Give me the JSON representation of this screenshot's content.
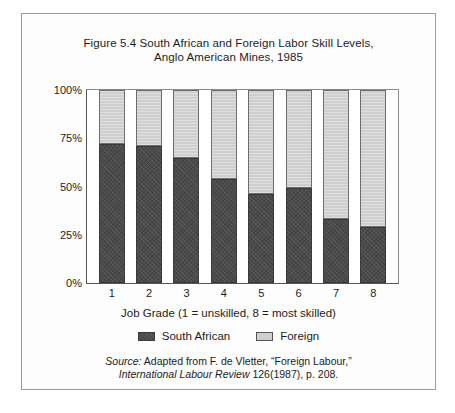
{
  "figure": {
    "title_line1": "Figure 5.4 South African and Foreign Labor Skill Levels,",
    "title_line2": "Anglo American Mines, 1985",
    "x_axis_title": "Job Grade (1 = unskilled, 8 = most skilled)",
    "source_italic_label": "Source:",
    "source_line1_rest": " Adapted from F. de Vletter, “Foreign Labour,”",
    "source_line2_italic": "International Labour Review",
    "source_line2_rest": " 126(1987), p. 208."
  },
  "colors": {
    "south_african": "#4a4a4a",
    "foreign": "#cfcfcf",
    "frame": "#9a9a9a",
    "axis": "#555555",
    "text": "#1c1c1c"
  },
  "legend": {
    "items": [
      {
        "label": "South African",
        "swatch": "#4a4a4a"
      },
      {
        "label": "Foreign",
        "swatch": "#cfcfcf"
      }
    ]
  },
  "chart_data": {
    "type": "bar",
    "subtype": "stacked-100-percent",
    "title": "Figure 5.4 South African and Foreign Labor Skill Levels, Anglo American Mines, 1985",
    "xlabel": "Job Grade (1 = unskilled, 8 = most skilled)",
    "ylabel": "",
    "categories": [
      "1",
      "2",
      "3",
      "4",
      "5",
      "6",
      "7",
      "8"
    ],
    "ytick_labels": [
      "0%",
      "25%",
      "50%",
      "75%",
      "100%"
    ],
    "ytick_values": [
      0,
      25,
      50,
      75,
      100
    ],
    "ylim": [
      0,
      100
    ],
    "grid": false,
    "legend_position": "bottom-center",
    "series": [
      {
        "name": "South African",
        "color": "#4a4a4a",
        "values": [
          72,
          71,
          65,
          54,
          46,
          49,
          33,
          29
        ]
      },
      {
        "name": "Foreign",
        "color": "#cfcfcf",
        "values": [
          28,
          29,
          35,
          46,
          54,
          51,
          67,
          71
        ]
      }
    ]
  }
}
